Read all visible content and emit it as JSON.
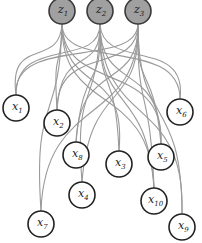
{
  "diagram": {
    "type": "bipartite-latent-graph",
    "colors": {
      "latent_fill": "#a0a0a0",
      "observed_fill": "#ffffff",
      "edge": "#9a9a9a",
      "outline": "#222222"
    },
    "latent_nodes": [
      {
        "id": "z1",
        "var": "z",
        "sub": "1"
      },
      {
        "id": "z2",
        "var": "z",
        "sub": "2"
      },
      {
        "id": "z3",
        "var": "z",
        "sub": "3"
      }
    ],
    "observed_nodes": [
      {
        "id": "x1",
        "var": "x",
        "sub": "1"
      },
      {
        "id": "x2",
        "var": "x",
        "sub": "2"
      },
      {
        "id": "x3",
        "var": "x",
        "sub": "3"
      },
      {
        "id": "x4",
        "var": "x",
        "sub": "4"
      },
      {
        "id": "x5",
        "var": "x",
        "sub": "5"
      },
      {
        "id": "x6",
        "var": "x",
        "sub": "6"
      },
      {
        "id": "x7",
        "var": "x",
        "sub": "7"
      },
      {
        "id": "x8",
        "var": "x",
        "sub": "8"
      },
      {
        "id": "x9",
        "var": "x",
        "sub": "9"
      },
      {
        "id": "x10",
        "var": "x",
        "sub": "10"
      }
    ],
    "edges": [
      [
        "z1",
        "x1"
      ],
      [
        "z1",
        "x2"
      ],
      [
        "z1",
        "x6"
      ],
      [
        "z1",
        "x5"
      ],
      [
        "z1",
        "x3"
      ],
      [
        "z1",
        "x7"
      ],
      [
        "z1",
        "x10"
      ],
      [
        "z2",
        "x1"
      ],
      [
        "z2",
        "x2"
      ],
      [
        "z2",
        "x8"
      ],
      [
        "z2",
        "x4"
      ],
      [
        "z2",
        "x3"
      ],
      [
        "z2",
        "x5"
      ],
      [
        "z2",
        "x9"
      ],
      [
        "z2",
        "x6"
      ],
      [
        "z2",
        "x10"
      ],
      [
        "z3",
        "x1"
      ],
      [
        "z3",
        "x2"
      ],
      [
        "z3",
        "x8"
      ],
      [
        "z3",
        "x4"
      ],
      [
        "z3",
        "x5"
      ],
      [
        "z3",
        "x10"
      ],
      [
        "z3",
        "x9"
      ],
      [
        "z3",
        "x7"
      ]
    ]
  }
}
